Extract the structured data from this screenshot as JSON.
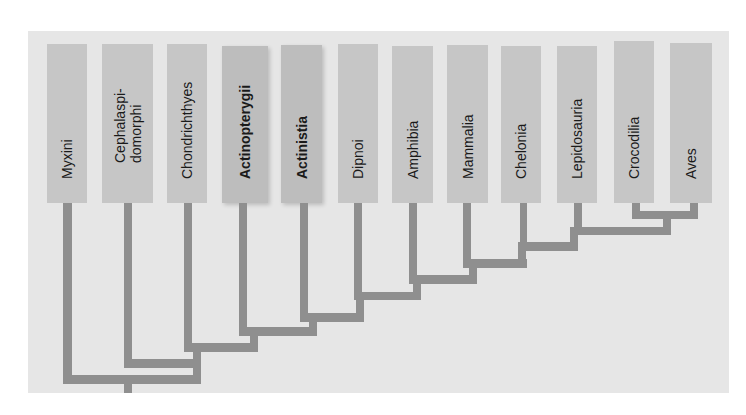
{
  "diagram": {
    "type": "cladogram",
    "colors": {
      "panel": "#e6e6e6",
      "taxon_box": "#c6c6c6",
      "taxon_box_highlight": "#bdbdbd",
      "branch": "#8f8f8f",
      "text": "#1a1a1a"
    },
    "taxa": [
      {
        "label": "Myxini",
        "bold": false
      },
      {
        "label": "Cephalaspi-\ndomorphi",
        "bold": false
      },
      {
        "label": "Chondrichthyes",
        "bold": false
      },
      {
        "label": "Actinopterygii",
        "bold": true
      },
      {
        "label": "Actinistia",
        "bold": true
      },
      {
        "label": "Dipnoi",
        "bold": false
      },
      {
        "label": "Amphibia",
        "bold": false
      },
      {
        "label": "Mammalia",
        "bold": false
      },
      {
        "label": "Chelonia",
        "bold": false
      },
      {
        "label": "Lepidosauria",
        "bold": false
      },
      {
        "label": "Crocodilia",
        "bold": false
      },
      {
        "label": "Aves",
        "bold": false
      }
    ],
    "topology": "(Myxini,(Cephalaspidomorphi,(Chondrichthyes,(Actinopterygii,(Actinistia,(Dipnoi,(Amphibia,(Mammalia,(Chelonia,(Lepidosauria,(Crocodilia,Aves)))))))))))"
  }
}
